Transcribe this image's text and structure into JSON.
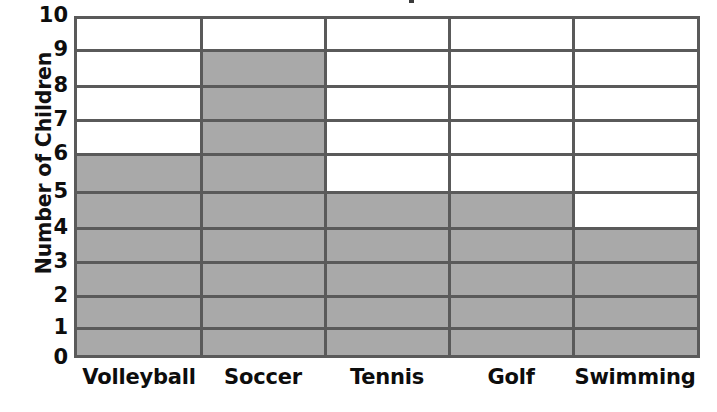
{
  "chart_data": {
    "type": "bar",
    "title": "",
    "xlabel": "",
    "ylabel": "Number of Children",
    "categories": [
      "Volleyball",
      "Soccer",
      "Tennis",
      "Golf",
      "Swimming"
    ],
    "values": [
      6,
      9,
      5,
      5,
      4
    ],
    "ylim": [
      0,
      10
    ],
    "ytick_labels": [
      "10",
      "9",
      "8",
      "7",
      "6",
      "5",
      "4",
      "3",
      "2",
      "1",
      "0"
    ],
    "ytick_values": [
      10,
      9,
      8,
      7,
      6,
      5,
      4,
      3,
      2,
      1,
      0
    ],
    "grid": true,
    "grid_axis": "y",
    "legend": false,
    "legend_position": "none",
    "orientation": "vertical",
    "bar_fill_color": "#a9a9a9",
    "grid_color": "#5a5a5a",
    "axis_line_color": "#5a5a5a",
    "text_color": "#0d0d0d",
    "background_color": "#ffffff"
  },
  "axes": {
    "y_title": "Number of Children",
    "y_ticks": [
      "10",
      "9",
      "8",
      "7",
      "6",
      "5",
      "4",
      "3",
      "2",
      "1",
      "0"
    ],
    "x_ticks": [
      "Volleyball",
      "Soccer",
      "Tennis",
      "Golf",
      "Swimming"
    ]
  }
}
